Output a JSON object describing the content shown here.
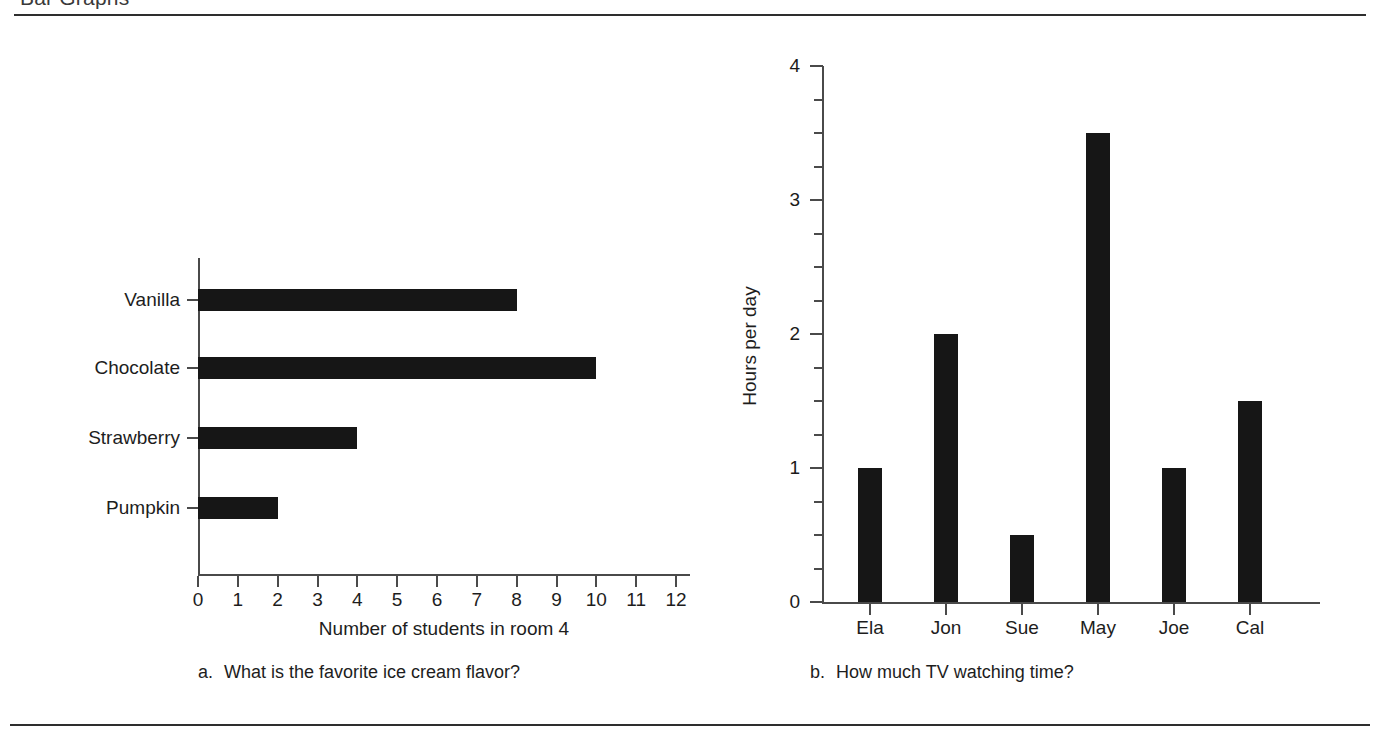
{
  "header": {
    "title": "Bar Graphs"
  },
  "figures": [
    {
      "id": "a",
      "caption_letter": "a.",
      "caption_text": "What is the favorite ice cream flavor?",
      "chart_data": {
        "type": "bar",
        "orientation": "horizontal",
        "title": "",
        "categories": [
          "Vanilla",
          "Chocolate",
          "Strawberry",
          "Pumpkin"
        ],
        "values": [
          8,
          10,
          4,
          2
        ],
        "xlabel": "Number of students in room 4",
        "ylabel": "",
        "xlim": [
          0,
          12
        ],
        "xticks": [
          0,
          1,
          2,
          3,
          4,
          5,
          6,
          7,
          8,
          9,
          10,
          11,
          12
        ],
        "xtick_labels": [
          "0",
          "1",
          "2",
          "3",
          "4",
          "5",
          "6",
          "7",
          "8",
          "9",
          "10",
          "11",
          "12"
        ],
        "grid": false,
        "legend": false,
        "bar_color": "#161616"
      }
    },
    {
      "id": "b",
      "caption_letter": "b.",
      "caption_text": "How much TV watching time?",
      "chart_data": {
        "type": "bar",
        "orientation": "vertical",
        "title": "",
        "categories": [
          "Ela",
          "Jon",
          "Sue",
          "May",
          "Joe",
          "Cal"
        ],
        "values": [
          1,
          2,
          0.5,
          3.5,
          1,
          1.5
        ],
        "xlabel": "",
        "ylabel": "Hours per day",
        "ylim": [
          0,
          4
        ],
        "yticks": [
          0,
          1,
          2,
          3,
          4
        ],
        "ytick_labels": [
          "0",
          "1",
          "2",
          "3",
          "4"
        ],
        "minor_tick_step": 0.25,
        "grid": false,
        "legend": false,
        "bar_color": "#161616"
      }
    }
  ],
  "colors": {
    "ink": "#161616",
    "axis": "#4a4a4a",
    "rule": "#2e2e2e",
    "background": "#ffffff"
  }
}
